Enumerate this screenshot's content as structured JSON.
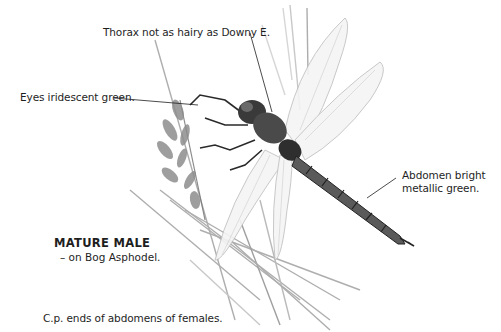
{
  "annotations": {
    "thorax": "Thorax not as hairy as Downy E.",
    "eyes": "Eyes iridescent green.",
    "abdomen_line1": "Abdomen bright",
    "abdomen_line2": "metallic green."
  },
  "caption": {
    "title": "MATURE MALE",
    "subtitle": "– on Bog Asphodel."
  },
  "footnote": "C.p. ends of abdomens of females.",
  "colors": {
    "ink": "#1e1e1e",
    "sketch_dark": "#3a3a3a",
    "sketch_mid": "#8a8a8a",
    "sketch_light": "#c8c8c8",
    "background": "#ffffff"
  }
}
